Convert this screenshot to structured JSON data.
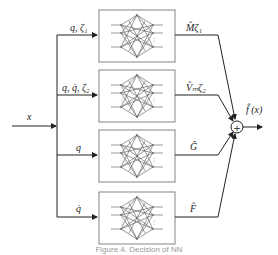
{
  "diagram": {
    "input_label": "x",
    "output_label": "f̂ (x)",
    "sum_symbol": "+",
    "branches": [
      {
        "input_label": "q, ζ₁",
        "output_label": "M̂ζ₁"
      },
      {
        "input_label": "q, q̇, ζ₂",
        "output_label": "V̂ₘζ₂"
      },
      {
        "input_label": "q",
        "output_label": "Ĝ"
      },
      {
        "input_label": "q̇",
        "output_label": "F̂"
      }
    ],
    "caption": "Figure 4. Decision of NN"
  }
}
